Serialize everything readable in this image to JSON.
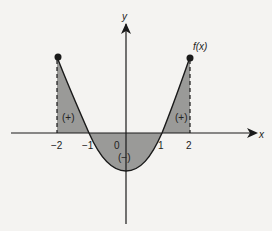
{
  "diagram": {
    "axes": {
      "x_label": "x",
      "y_label": "y"
    },
    "function_label": "f(x)",
    "ticks": [
      {
        "value": "-2",
        "label": "−2"
      },
      {
        "value": "-1",
        "label": "−1"
      },
      {
        "value": "0",
        "label": "0"
      },
      {
        "value": "1",
        "label": "1"
      },
      {
        "value": "2",
        "label": "2"
      }
    ],
    "regions": [
      {
        "name": "left-positive",
        "interval": "[-2, -1]",
        "sign_label": "(+)"
      },
      {
        "name": "middle-negative",
        "interval": "[-1, 1]",
        "sign_label": "(−)"
      },
      {
        "name": "right-positive",
        "interval": "[1, 2]",
        "sign_label": "(+)"
      }
    ],
    "endpoints": [
      "(-2, f(-2))",
      "(2, f(2))"
    ],
    "colors": {
      "shade": "#9a9a98",
      "line": "#1a1a1a",
      "background": "#f4f3f1"
    }
  }
}
